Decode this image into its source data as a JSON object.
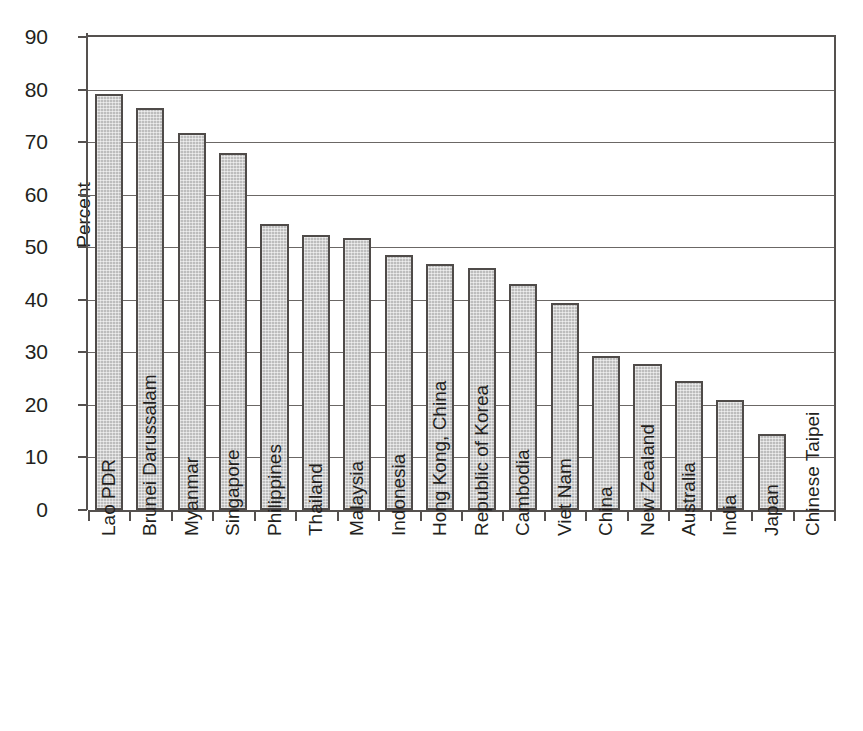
{
  "figure": {
    "scan_artifact_text": "",
    "background_color": "#ffffff",
    "bar_fill_color": "#bdbdbd",
    "bar_border_color": "#4f4b49",
    "axis_color": "#55514f",
    "gridline_color": "#6b6765",
    "text_color": "#231f20"
  },
  "chart_data": {
    "type": "bar",
    "title": "",
    "subtitle": "",
    "xlabel": "",
    "ylabel": "Percent",
    "ylim": [
      0,
      90
    ],
    "ytick_step": 10,
    "ytick_labels": [
      "0",
      "10",
      "20",
      "30",
      "40",
      "50",
      "60",
      "70",
      "80",
      "90"
    ],
    "ytick_values": [
      0,
      10,
      20,
      30,
      40,
      50,
      60,
      70,
      80,
      90
    ],
    "grid": "horizontal",
    "legend": "none",
    "orientation": "vertical",
    "categories": [
      "Lao PDR",
      "Brunei Darussalam",
      "Myanmar",
      "Singapore",
      "Philippines",
      "Thailand",
      "Malaysia",
      "Indonesia",
      "Hong Kong, China",
      "Republic of Korea",
      "Cambodia",
      "Viet Nam",
      "China",
      "New Zealand",
      "Australia",
      "India",
      "Japan",
      "Chinese Taipei"
    ],
    "values": [
      79.2,
      76.5,
      71.7,
      68.0,
      54.5,
      52.3,
      51.8,
      48.5,
      46.8,
      46.1,
      43.1,
      39.4,
      29.3,
      27.8,
      24.6,
      21.0,
      14.4,
      0.0
    ],
    "series": [
      {
        "name": "Percent",
        "values": [
          79.2,
          76.5,
          71.7,
          68.0,
          54.5,
          52.3,
          51.8,
          48.5,
          46.8,
          46.1,
          43.1,
          39.4,
          29.3,
          27.8,
          24.6,
          21.0,
          14.4,
          0.0
        ]
      }
    ]
  }
}
